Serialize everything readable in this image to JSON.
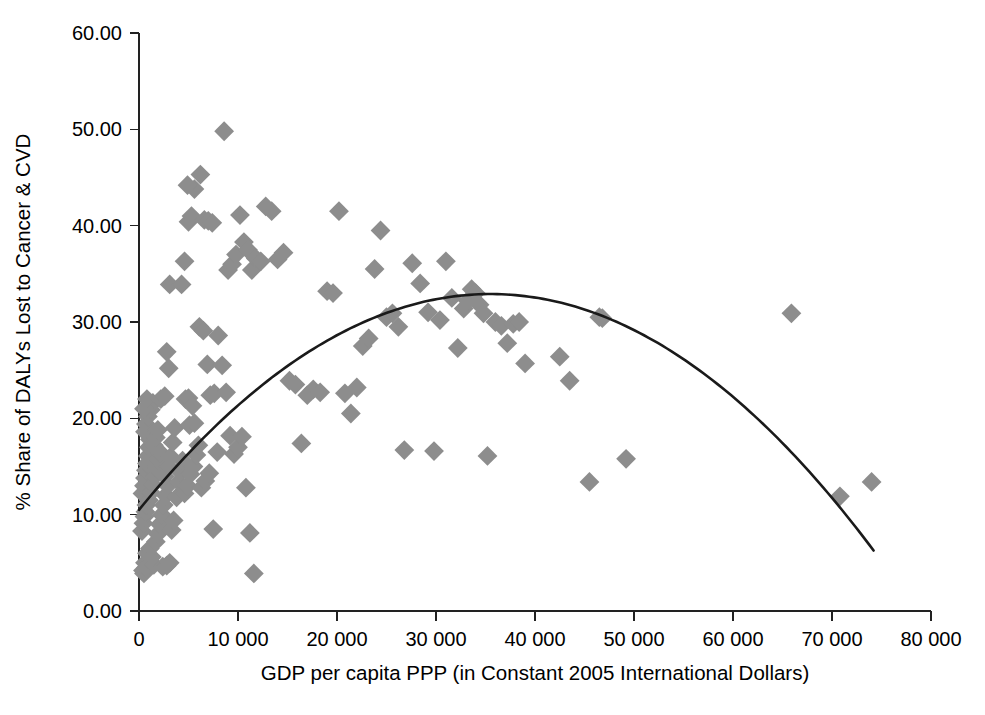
{
  "chart_data": {
    "type": "scatter",
    "title": "",
    "xlabel": "GDP per capita PPP (in Constant 2005 International Dollars)",
    "ylabel": "% Share of DALYs Lost to Cancer & CVD",
    "xlim": [
      0,
      80000
    ],
    "ylim": [
      0,
      60
    ],
    "grid": false,
    "legend": null,
    "xticks": [
      0,
      10000,
      20000,
      30000,
      40000,
      50000,
      60000,
      70000,
      80000
    ],
    "xtick_labels": [
      "0",
      "10 000",
      "20 000",
      "30 000",
      "40 000",
      "50 000",
      "60 000",
      "70 000",
      "80 000"
    ],
    "yticks": [
      0,
      10,
      20,
      30,
      40,
      50,
      60
    ],
    "ytick_labels": [
      "0.00",
      "10.00",
      "20.00",
      "30.00",
      "40.00",
      "50.00",
      "60.00"
    ],
    "marker_shape": "diamond",
    "marker_color": "#8d8d8d",
    "marker_size": 14,
    "series": [
      {
        "name": "Countries",
        "points": [
          [
            400,
            4.2
          ],
          [
            500,
            3.9
          ],
          [
            600,
            5.0
          ],
          [
            700,
            4.5
          ],
          [
            800,
            6.0
          ],
          [
            300,
            8.3
          ],
          [
            450,
            9.1
          ],
          [
            550,
            9.8
          ],
          [
            650,
            10.3
          ],
          [
            750,
            11.0
          ],
          [
            350,
            12.2
          ],
          [
            500,
            13.0
          ],
          [
            600,
            13.8
          ],
          [
            700,
            14.6
          ],
          [
            800,
            15.3
          ],
          [
            900,
            16.1
          ],
          [
            1000,
            17.0
          ],
          [
            1100,
            17.8
          ],
          [
            600,
            18.6
          ],
          [
            700,
            19.4
          ],
          [
            900,
            20.2
          ],
          [
            1200,
            20.9
          ],
          [
            1400,
            21.6
          ],
          [
            500,
            21.0
          ],
          [
            800,
            22.0
          ],
          [
            1000,
            11.5
          ],
          [
            1200,
            12.3
          ],
          [
            1400,
            13.1
          ],
          [
            1600,
            14.0
          ],
          [
            1800,
            14.8
          ],
          [
            2000,
            15.6
          ],
          [
            2200,
            16.4
          ],
          [
            1500,
            17.2
          ],
          [
            1700,
            18.0
          ],
          [
            1900,
            18.8
          ],
          [
            1100,
            6.5
          ],
          [
            1300,
            5.6
          ],
          [
            1500,
            4.8
          ],
          [
            1700,
            7.2
          ],
          [
            1900,
            8.0
          ],
          [
            2100,
            9.0
          ],
          [
            2300,
            10.0
          ],
          [
            2500,
            11.0
          ],
          [
            2700,
            12.0
          ],
          [
            2900,
            13.0
          ],
          [
            2400,
            4.6
          ],
          [
            2800,
            4.7
          ],
          [
            3100,
            5.0
          ],
          [
            3300,
            8.4
          ],
          [
            3500,
            9.4
          ],
          [
            2600,
            14.0
          ],
          [
            3000,
            15.0
          ],
          [
            3200,
            16.0
          ],
          [
            3400,
            17.5
          ],
          [
            3600,
            19.0
          ],
          [
            2200,
            22.0
          ],
          [
            2600,
            22.3
          ],
          [
            3000,
            25.2
          ],
          [
            2800,
            26.9
          ],
          [
            3100,
            33.9
          ],
          [
            3800,
            11.8
          ],
          [
            4000,
            13.4
          ],
          [
            4200,
            14.4
          ],
          [
            4400,
            15.6
          ],
          [
            4600,
            12.2
          ],
          [
            4900,
            13.0
          ],
          [
            5200,
            14.2
          ],
          [
            5500,
            15.0
          ],
          [
            5800,
            16.2
          ],
          [
            6000,
            17.2
          ],
          [
            4700,
            22.0
          ],
          [
            5000,
            22.1
          ],
          [
            5400,
            21.3
          ],
          [
            5100,
            19.3
          ],
          [
            5600,
            19.5
          ],
          [
            4300,
            33.9
          ],
          [
            4600,
            36.3
          ],
          [
            5000,
            40.4
          ],
          [
            5300,
            41.0
          ],
          [
            5600,
            43.8
          ],
          [
            4900,
            44.2
          ],
          [
            6200,
            45.3
          ],
          [
            6600,
            40.6
          ],
          [
            7000,
            40.5
          ],
          [
            7400,
            40.3
          ],
          [
            6100,
            29.5
          ],
          [
            6500,
            29.1
          ],
          [
            6900,
            25.6
          ],
          [
            7200,
            22.4
          ],
          [
            7600,
            22.6
          ],
          [
            6300,
            12.8
          ],
          [
            6700,
            13.5
          ],
          [
            7100,
            14.3
          ],
          [
            7500,
            8.5
          ],
          [
            7900,
            16.5
          ],
          [
            8600,
            49.8
          ],
          [
            8000,
            28.6
          ],
          [
            8400,
            25.5
          ],
          [
            8800,
            22.7
          ],
          [
            9200,
            18.2
          ],
          [
            9600,
            16.3
          ],
          [
            10000,
            17.0
          ],
          [
            10400,
            18.1
          ],
          [
            10800,
            12.8
          ],
          [
            11200,
            8.1
          ],
          [
            11600,
            3.9
          ],
          [
            9000,
            35.4
          ],
          [
            9400,
            36.0
          ],
          [
            9800,
            37.0
          ],
          [
            10200,
            41.1
          ],
          [
            10600,
            38.3
          ],
          [
            11000,
            37.5
          ],
          [
            11400,
            35.4
          ],
          [
            11800,
            36.6
          ],
          [
            12300,
            36.3
          ],
          [
            12800,
            42.0
          ],
          [
            13400,
            41.5
          ],
          [
            14000,
            36.5
          ],
          [
            14600,
            37.2
          ],
          [
            15200,
            23.9
          ],
          [
            15800,
            23.5
          ],
          [
            16400,
            17.4
          ],
          [
            17000,
            22.4
          ],
          [
            17600,
            23.0
          ],
          [
            18300,
            22.7
          ],
          [
            19000,
            33.2
          ],
          [
            19600,
            33.0
          ],
          [
            20200,
            41.5
          ],
          [
            20800,
            22.6
          ],
          [
            21400,
            20.5
          ],
          [
            22000,
            23.2
          ],
          [
            22600,
            27.5
          ],
          [
            23200,
            28.3
          ],
          [
            23800,
            35.5
          ],
          [
            24400,
            39.5
          ],
          [
            25000,
            30.5
          ],
          [
            25600,
            30.9
          ],
          [
            26200,
            29.5
          ],
          [
            26800,
            16.7
          ],
          [
            27600,
            36.1
          ],
          [
            28400,
            34.0
          ],
          [
            29200,
            31.0
          ],
          [
            29800,
            16.6
          ],
          [
            30400,
            30.2
          ],
          [
            31000,
            36.3
          ],
          [
            31600,
            32.5
          ],
          [
            32200,
            27.3
          ],
          [
            32800,
            31.4
          ],
          [
            33200,
            32.2
          ],
          [
            33600,
            33.4
          ],
          [
            34000,
            33.0
          ],
          [
            34400,
            31.8
          ],
          [
            34800,
            30.9
          ],
          [
            35200,
            16.1
          ],
          [
            36000,
            30.0
          ],
          [
            36600,
            29.6
          ],
          [
            37200,
            27.8
          ],
          [
            37800,
            29.8
          ],
          [
            38400,
            30.0
          ],
          [
            39000,
            25.7
          ],
          [
            42500,
            26.4
          ],
          [
            43500,
            23.9
          ],
          [
            45500,
            13.4
          ],
          [
            46500,
            30.5
          ],
          [
            46800,
            30.4
          ],
          [
            49200,
            15.8
          ],
          [
            65900,
            30.9
          ],
          [
            70800,
            11.9
          ],
          [
            74000,
            13.4
          ]
        ]
      }
    ],
    "fit_curve": {
      "type": "quadratic-polynomial",
      "description": "fitted inverted-U trend line",
      "color": "#1a1a1a",
      "x_start": 0,
      "x_end": 74200,
      "y_start": 10.5,
      "y_peak": 32.9,
      "x_peak": 35500,
      "y_end": 5.4
    }
  },
  "axes": {
    "x_title": "GDP per capita PPP (in Constant 2005 International Dollars)",
    "y_title": "% Share of DALYs Lost to Cancer & CVD"
  }
}
